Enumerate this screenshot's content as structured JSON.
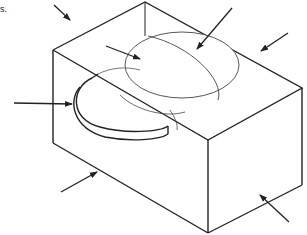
{
  "figure": {
    "caption_fragment": "s.",
    "line_color": "#222222",
    "background": "#ffffff",
    "arrows": [
      {
        "id": "arrow-top-left-edge",
        "target": "top-left edge"
      },
      {
        "id": "arrow-dome-left",
        "target": "dome surface"
      },
      {
        "id": "arrow-dome-ridge",
        "target": "dome ridge curve"
      },
      {
        "id": "arrow-top-face-right",
        "target": "top face"
      },
      {
        "id": "arrow-semicircle-recess",
        "target": "semicircular recess"
      },
      {
        "id": "arrow-bottom-left-edge",
        "target": "bottom-left edge"
      },
      {
        "id": "arrow-right-face",
        "target": "right front face"
      }
    ]
  }
}
